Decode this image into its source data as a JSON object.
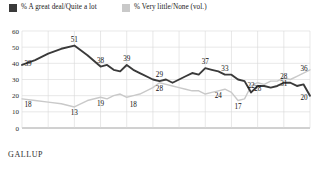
{
  "legend": {
    "items": [
      {
        "label": "% A great deal/Quite a lot",
        "color": "#3a3a3a",
        "icon": "legend-swatch-icon"
      },
      {
        "label": "% Very little/None (vol.)",
        "color": "#c9c9c9",
        "icon": "legend-swatch-icon"
      }
    ]
  },
  "footer": {
    "source": "GALLUP"
  },
  "chart_data": {
    "type": "line",
    "title": "",
    "subtitle": "",
    "xlabel": "",
    "ylabel": "",
    "xlim": [
      1973,
      2017
    ],
    "ylim": [
      0,
      60
    ],
    "yticks": [
      0,
      10,
      20,
      30,
      40,
      50,
      60
    ],
    "xticks": [
      1973,
      1977,
      1981,
      1985,
      1989,
      1993,
      1997,
      2001,
      2005,
      2009,
      2013,
      2017
    ],
    "grid": true,
    "legend_position": "top",
    "x": [
      1973,
      1975,
      1977,
      1979,
      1981,
      1983,
      1985,
      1986,
      1987,
      1988,
      1989,
      1990,
      1991,
      1993,
      1994,
      1995,
      1996,
      1997,
      1998,
      1999,
      2000,
      2001,
      2002,
      2003,
      2004,
      2005,
      2006,
      2007,
      2008,
      2009,
      2010,
      2011,
      2012,
      2013,
      2014,
      2015,
      2016,
      2017
    ],
    "series": [
      {
        "name": "% A great deal/Quite a lot",
        "color": "#3a3a3a",
        "values": [
          39,
          42,
          46,
          49,
          51,
          45,
          38,
          39,
          36,
          35,
          39,
          36,
          34,
          30,
          29,
          30,
          28,
          30,
          32,
          34,
          33,
          37,
          36,
          35,
          33,
          33,
          30,
          29,
          22,
          26,
          26,
          25,
          26,
          28,
          28,
          26,
          27,
          20
        ],
        "labels": [
          {
            "x": 1973,
            "value": 39
          },
          {
            "x": 1981,
            "value": 51
          },
          {
            "x": 1985,
            "value": 38
          },
          {
            "x": 1989,
            "value": 39
          },
          {
            "x": 1994,
            "value": 29
          },
          {
            "x": 2001,
            "value": 37
          },
          {
            "x": 2004,
            "value": 33
          },
          {
            "x": 2008,
            "value": 22
          },
          {
            "x": 2013,
            "value": 28
          },
          {
            "x": 2017,
            "value": 20
          }
        ]
      },
      {
        "name": "% Very little/None (vol.)",
        "color": "#c9c9c9",
        "values": [
          18,
          17,
          16,
          15,
          13,
          17,
          19,
          18,
          20,
          21,
          19,
          20,
          21,
          25,
          28,
          27,
          26,
          25,
          24,
          23,
          23,
          21,
          22,
          23,
          24,
          22,
          17,
          18,
          26,
          28,
          27,
          29,
          29,
          31,
          30,
          32,
          34,
          36
        ],
        "labels": [
          {
            "x": 1973,
            "value": 18
          },
          {
            "x": 1981,
            "value": 13
          },
          {
            "x": 1985,
            "value": 19
          },
          {
            "x": 1990,
            "value": 18
          },
          {
            "x": 1994,
            "value": 28
          },
          {
            "x": 2003,
            "value": 24
          },
          {
            "x": 2006,
            "value": 17
          },
          {
            "x": 2009,
            "value": 28
          },
          {
            "x": 2013,
            "value": 31
          },
          {
            "x": 2017,
            "value": 36
          }
        ]
      }
    ]
  }
}
